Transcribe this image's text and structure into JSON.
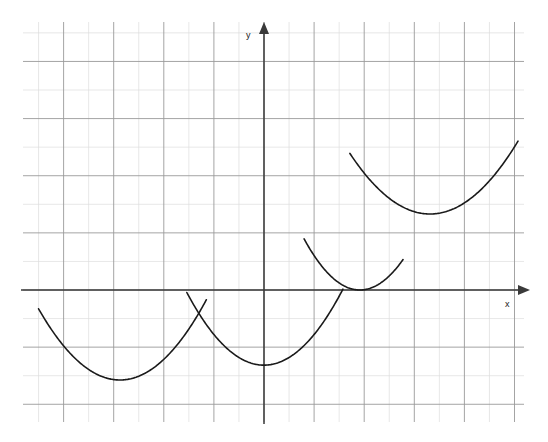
{
  "figure": {
    "title": "",
    "background_color": "#ffffff",
    "width": 548,
    "height": 442
  },
  "axes": {
    "x_axis_label": "x",
    "y_axis_label": "y",
    "axis_color": "#3a3a3a",
    "x_axis_pixel_y": 290,
    "y_axis_pixel_x": 264,
    "x_axis_arrow": true,
    "y_axis_arrow": true
  },
  "grid": {
    "minor_color": "#dcdcdc",
    "major_color": "#9a9a9a",
    "left": 23,
    "right": 524,
    "top": 22,
    "bottom": 422,
    "cell_width": 25.05,
    "cell_height": 28.57,
    "major_every_x": 2,
    "major_every_y": 2,
    "show_grid": true
  },
  "chart_data": {
    "type": "line",
    "title": "",
    "subtitle": "",
    "xlabel": "x",
    "ylabel": "y",
    "grid": true,
    "legend": "none",
    "xlim": [
      -9.6,
      10.4
    ],
    "ylim": [
      -4.6,
      9.4
    ],
    "unit_pixels": {
      "x": 25.05,
      "y": 28.57
    },
    "origin_pixels": {
      "x": 264,
      "y": 290
    },
    "annotations": [],
    "series": [
      {
        "name": "parabola-1",
        "curve_type": "parabola",
        "vertex": [
          -5.75,
          -3.15
        ],
        "vertex_pixels": [
          120,
          380
        ],
        "coefficient_a": 0.236,
        "x_domain": [
          -9.0,
          -2.3
        ],
        "points": [
          [
            -9.0,
            0.88
          ],
          [
            -8.5,
            0.33
          ],
          [
            -8.0,
            -0.17
          ],
          [
            -7.5,
            -0.62
          ],
          [
            -7.0,
            -1.01
          ],
          [
            -6.5,
            -1.34
          ],
          [
            -6.0,
            -1.58
          ],
          [
            -5.75,
            -3.15
          ],
          [
            -5.5,
            -1.58
          ],
          [
            -5.0,
            -1.34
          ],
          [
            -4.5,
            -1.01
          ],
          [
            -4.0,
            -0.62
          ],
          [
            -3.5,
            -0.17
          ],
          [
            -3.0,
            0.33
          ],
          [
            -2.5,
            0.88
          ],
          [
            -2.3,
            1.12
          ]
        ]
      },
      {
        "name": "parabola-2",
        "curve_type": "parabola",
        "vertex": [
          0.0,
          -2.63
        ],
        "vertex_pixels": [
          264,
          365
        ],
        "coefficient_a": 0.268,
        "x_domain": [
          -3.08,
          3.15
        ],
        "points": [
          [
            -3.08,
            -0.09
          ],
          [
            -2.5,
            -0.95
          ],
          [
            -2.0,
            -1.56
          ],
          [
            -1.5,
            -2.03
          ],
          [
            -1.0,
            -2.36
          ],
          [
            -0.5,
            -2.56
          ],
          [
            0.0,
            -2.63
          ],
          [
            0.5,
            -2.56
          ],
          [
            1.0,
            -2.36
          ],
          [
            1.5,
            -2.03
          ],
          [
            2.0,
            -1.56
          ],
          [
            2.5,
            -0.95
          ],
          [
            3.15,
            -0.02
          ]
        ]
      },
      {
        "name": "parabola-3",
        "curve_type": "parabola",
        "vertex": [
          3.83,
          0.0
        ],
        "vertex_pixels": [
          360,
          290
        ],
        "coefficient_a": 0.36,
        "x_domain": [
          1.6,
          5.55
        ],
        "points": [
          [
            1.6,
            1.82
          ],
          [
            2.0,
            1.19
          ],
          [
            2.5,
            0.63
          ],
          [
            3.0,
            0.24
          ],
          [
            3.5,
            0.04
          ],
          [
            3.83,
            0.0
          ],
          [
            4.2,
            0.05
          ],
          [
            4.6,
            0.21
          ],
          [
            5.0,
            0.48
          ],
          [
            5.55,
            1.04
          ]
        ]
      },
      {
        "name": "parabola-4",
        "curve_type": "parabola",
        "vertex": [
          6.63,
          2.66
        ],
        "vertex_pixels": [
          430,
          214
        ],
        "coefficient_a": 0.207,
        "x_domain": [
          3.43,
          10.14
        ],
        "points": [
          [
            3.43,
            4.78
          ],
          [
            4.0,
            3.93
          ],
          [
            4.5,
            3.27
          ],
          [
            5.0,
            2.72
          ],
          [
            5.5,
            2.28
          ],
          [
            6.0,
            1.96
          ],
          [
            6.63,
            2.66
          ],
          [
            7.0,
            1.96
          ],
          [
            7.5,
            2.28
          ],
          [
            8.0,
            2.72
          ],
          [
            8.5,
            3.27
          ],
          [
            9.0,
            3.93
          ],
          [
            9.5,
            4.7
          ],
          [
            10.14,
            5.81
          ]
        ]
      }
    ]
  },
  "curves": {
    "stroke_color": "#1a1a1a",
    "stroke_width": 1.6,
    "paths": [
      {
        "name": "curve-1",
        "d": "M 38,232 Q 120,530 203,232"
      },
      {
        "name": "curve-2",
        "d": "M 187,190 Q 264,540 341,190"
      },
      {
        "name": "curve-3",
        "d": "M 304,110 Q 360,470 343,192"
      },
      {
        "name": "curve-4",
        "d": "M 350,38 Q 430,389 518,40"
      }
    ]
  }
}
